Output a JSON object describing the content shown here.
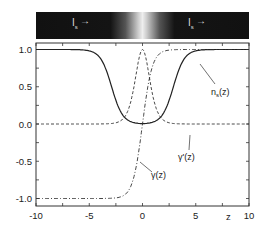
{
  "chart_data": {
    "type": "line",
    "title": "",
    "xlabel": "z",
    "ylabel": "",
    "xlim": [
      -10,
      10
    ],
    "ylim": [
      -1.1,
      1.1
    ],
    "xticks": [
      "-10",
      "-5",
      "0",
      "5",
      "10"
    ],
    "yticks": [
      "1.0",
      "0.5",
      "0.0",
      "-0.5",
      "-1.0"
    ],
    "grid": false,
    "legend": "inline annotations",
    "series": [
      {
        "name": "n_s(z)",
        "style": "solid",
        "x": [
          -10,
          -6,
          -4,
          -3,
          -2,
          -1,
          0,
          1,
          2,
          3,
          4,
          6,
          10
        ],
        "values": [
          1,
          1,
          0.97,
          0.7,
          0.2,
          0.02,
          0,
          0.02,
          0.2,
          0.7,
          0.97,
          1,
          1
        ]
      },
      {
        "name": "gamma'(z)",
        "style": "dashed",
        "x": [
          -10,
          -4,
          -3,
          -2,
          -1,
          0,
          1,
          2,
          3,
          4,
          10
        ],
        "values": [
          0,
          0,
          0.01,
          0.1,
          0.6,
          1.0,
          0.6,
          0.1,
          0.01,
          0,
          0
        ]
      },
      {
        "name": "gamma(z)",
        "style": "dash-dot",
        "x": [
          -10,
          -4,
          -3,
          -2,
          -1,
          0,
          1,
          2,
          3,
          4,
          10
        ],
        "values": [
          -1,
          -1,
          -0.99,
          -0.95,
          -0.7,
          0,
          0.7,
          0.95,
          0.99,
          1,
          1
        ]
      }
    ],
    "annotations": [
      "n_s(z)",
      "γ'(z)",
      "γ(z)"
    ],
    "inset_bar": {
      "left_label": "I_s →",
      "right_label": "I_s →"
    }
  },
  "labels": {
    "bar_left": "I",
    "bar_left_sub": "s",
    "bar_right": "I",
    "bar_right_sub": "s",
    "xlabel": "z",
    "ns": "n",
    "ns_sub": "s",
    "ns_tail": "(z)",
    "gprime": "γ'(z)",
    "gamma": "γ(z)"
  }
}
